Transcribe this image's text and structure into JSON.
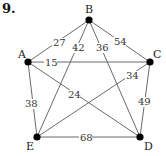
{
  "problem_number": "9.",
  "graph": {
    "nodes": [
      {
        "id": "A",
        "x": 28,
        "y": 62,
        "lx": 18,
        "ly": 58
      },
      {
        "id": "B",
        "x": 89,
        "y": 20,
        "lx": 85,
        "ly": 13
      },
      {
        "id": "C",
        "x": 150,
        "y": 62,
        "lx": 153,
        "ly": 58
      },
      {
        "id": "D",
        "x": 140,
        "y": 137,
        "lx": 144,
        "ly": 150
      },
      {
        "id": "E",
        "x": 37,
        "y": 137,
        "lx": 26,
        "ly": 150
      }
    ],
    "edges": [
      {
        "from": "A",
        "to": "B",
        "weight": "27",
        "wx": 53,
        "wy": 46
      },
      {
        "from": "B",
        "to": "E",
        "weight": "42",
        "wx": 72,
        "wy": 51
      },
      {
        "from": "B",
        "to": "D",
        "weight": "36",
        "wx": 96,
        "wy": 51
      },
      {
        "from": "B",
        "to": "C",
        "weight": "54",
        "wx": 114,
        "wy": 45
      },
      {
        "from": "A",
        "to": "C",
        "weight": "15",
        "wx": 45,
        "wy": 66
      },
      {
        "from": "A",
        "to": "D",
        "weight": "24",
        "wx": 68,
        "wy": 98
      },
      {
        "from": "E",
        "to": "C",
        "weight": "34",
        "wx": 126,
        "wy": 79
      },
      {
        "from": "A",
        "to": "E",
        "weight": "38",
        "wx": 25,
        "wy": 107
      },
      {
        "from": "C",
        "to": "D",
        "weight": "49",
        "wx": 138,
        "wy": 105
      },
      {
        "from": "E",
        "to": "D",
        "weight": "68",
        "wx": 80,
        "wy": 141
      }
    ]
  },
  "colors": {
    "edge": "#6b6b6b",
    "node": "#000000",
    "text": "#222222"
  }
}
